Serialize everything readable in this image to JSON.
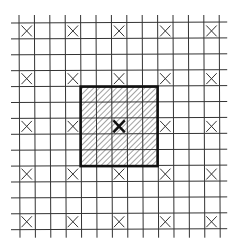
{
  "diagram": {
    "grid": {
      "columns": 13,
      "rows": 13
    },
    "marked_cells": {
      "marker": "x-cross",
      "columns": [
        0,
        3,
        6,
        9,
        12
      ],
      "rows": [
        0,
        3,
        6,
        9,
        12
      ]
    },
    "shaded_block": {
      "fill": "diagonal-hatch",
      "start_column": 4,
      "start_row": 4,
      "span_columns": 5,
      "span_rows": 5,
      "border": "thick",
      "center_marker": {
        "column": 6,
        "row": 6,
        "marker": "x-cross-bold"
      }
    },
    "colors": {
      "line": "#333333",
      "background": "#ffffff",
      "hatch": "#555555"
    }
  }
}
